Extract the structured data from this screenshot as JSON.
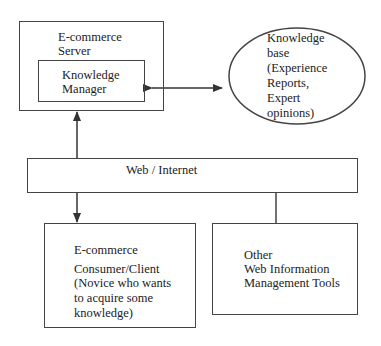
{
  "diagram": {
    "server": {
      "title_lines": [
        "E-commerce",
        "Server"
      ],
      "inner_box": {
        "title_lines": [
          "Knowledge",
          "Manager"
        ]
      }
    },
    "knowledge_base": {
      "lines": [
        "Knowledge",
        "base",
        "(Experience",
        "Reports,",
        "Expert",
        "opinions)"
      ]
    },
    "web": {
      "label": "Web / Internet"
    },
    "client": {
      "lines": [
        "E-commerce",
        "Consumer/Client",
        "(Novice who wants",
        "to acquire some",
        "knowledge)"
      ]
    },
    "other_tools": {
      "lines": [
        "Other",
        "Web Information",
        "Management Tools"
      ]
    },
    "connections": [
      {
        "from": "knowledge_manager",
        "to": "knowledge_base",
        "type": "bidirectional-arrow"
      },
      {
        "from": "web",
        "to": "server",
        "type": "arrow"
      },
      {
        "from": "web",
        "to": "client",
        "type": "arrow"
      },
      {
        "from": "web",
        "to": "other_tools",
        "type": "line"
      }
    ],
    "colors": {
      "stroke": "#444444",
      "text": "#222222",
      "background": "#ffffff"
    }
  }
}
